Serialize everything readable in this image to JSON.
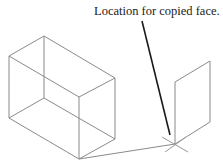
{
  "annotation": {
    "text": "Location for copied face."
  },
  "colors": {
    "wireframe": "#8a8a8a",
    "leader": "#1a1a1a",
    "background": "#ffffff"
  },
  "figure": {
    "box": {
      "vertices": {
        "top_back": [
          44,
          36
        ],
        "top_left": [
          9,
          56
        ],
        "top_right": [
          115,
          78
        ],
        "top_front": [
          79,
          97
        ],
        "bottom_left": [
          9,
          118
        ],
        "bottom_back": [
          44,
          98
        ],
        "bottom_right": [
          115,
          139
        ],
        "bottom_front": [
          79,
          159
        ]
      }
    },
    "copied_face": {
      "vertices": [
        [
          175,
          82
        ],
        [
          210,
          61
        ],
        [
          210,
          122
        ],
        [
          175,
          144
        ]
      ]
    },
    "target_point": [
      175,
      144
    ],
    "leader_line": {
      "from": [
        142,
        21
      ],
      "to": [
        170,
        135
      ]
    }
  }
}
